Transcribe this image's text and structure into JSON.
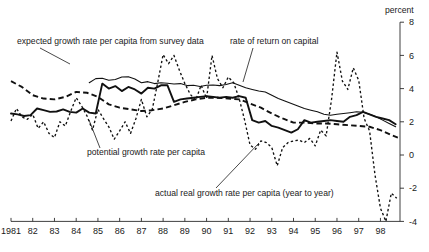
{
  "chart_data": {
    "type": "line",
    "title": "",
    "xlabel": "",
    "ylabel": "percent",
    "ylabel_position": "top-right",
    "grid": false,
    "legend": "annotations-with-leader-lines",
    "xlim": [
      1981.0,
      1998.9
    ],
    "ylim": [
      -4,
      8
    ],
    "yticks": [
      8,
      6,
      4,
      2,
      0,
      -2,
      -4
    ],
    "ytick_labels": [
      "8",
      "6",
      "4",
      "2",
      "0",
      "-2",
      "-4"
    ],
    "xticks": [
      1981,
      1982,
      1983,
      1984,
      1985,
      1986,
      1987,
      1988,
      1989,
      1990,
      1991,
      1992,
      1993,
      1994,
      1995,
      1996,
      1997,
      1998
    ],
    "xtick_labels": [
      "1981",
      "82",
      "83",
      "84",
      "85",
      "86",
      "87",
      "88",
      "89",
      "90",
      "91",
      "92",
      "93",
      "94",
      "95",
      "96",
      "97",
      "98"
    ],
    "axis_side": "right",
    "series": [
      {
        "name": "rate of return on capital",
        "style": "solid-thin",
        "x": [
          1984.6,
          1984.9,
          1985.2,
          1985.5,
          1985.8,
          1986.1,
          1986.4,
          1986.7,
          1987.0,
          1987.3,
          1987.6,
          1987.9,
          1988.2,
          1988.5,
          1988.8,
          1989.1,
          1989.4,
          1989.7,
          1990.0,
          1990.3,
          1990.6,
          1990.9,
          1991.2,
          1991.5,
          1991.8,
          1992.1,
          1992.4,
          1992.7,
          1993.0,
          1993.3,
          1993.6,
          1993.9,
          1994.2,
          1994.5,
          1994.8,
          1995.1,
          1995.4,
          1995.7,
          1996.0,
          1996.3,
          1996.6,
          1996.9,
          1997.2,
          1997.5,
          1997.8,
          1998.1,
          1998.4,
          1998.7
        ],
        "values": [
          4.35,
          4.6,
          4.62,
          4.5,
          4.55,
          4.7,
          4.72,
          4.58,
          4.35,
          4.42,
          4.3,
          4.35,
          4.32,
          4.28,
          4.3,
          4.18,
          4.2,
          4.12,
          4.2,
          4.22,
          4.18,
          4.25,
          4.35,
          4.2,
          4.05,
          3.95,
          3.85,
          3.8,
          3.6,
          3.4,
          3.25,
          3.1,
          2.95,
          2.8,
          2.7,
          2.6,
          2.45,
          2.4,
          2.45,
          2.5,
          2.55,
          2.6,
          2.58,
          2.45,
          2.3,
          2.1,
          1.9,
          1.7
        ]
      },
      {
        "name": "potential growth rate per capita",
        "style": "solid-thick",
        "x": [
          1981.0,
          1981.3,
          1981.6,
          1981.9,
          1982.2,
          1982.5,
          1982.8,
          1983.1,
          1983.4,
          1983.7,
          1984.0,
          1984.3,
          1984.6,
          1984.9,
          1985.2,
          1985.5,
          1985.8,
          1986.1,
          1986.4,
          1986.7,
          1987.0,
          1987.3,
          1987.6,
          1987.9,
          1988.2,
          1988.5,
          1988.8,
          1989.1,
          1989.4,
          1989.7,
          1990.0,
          1990.3,
          1990.6,
          1990.9,
          1991.2,
          1991.5,
          1991.8,
          1992.1,
          1992.4,
          1992.7,
          1993.0,
          1993.3,
          1993.6,
          1993.9,
          1994.2,
          1994.5,
          1994.8,
          1995.1,
          1995.4,
          1995.7,
          1996.0,
          1996.3,
          1996.6,
          1996.9,
          1997.2,
          1997.5,
          1997.8,
          1998.1,
          1998.4,
          1998.7
        ],
        "values": [
          2.5,
          2.45,
          2.35,
          2.4,
          2.8,
          2.7,
          2.6,
          2.62,
          2.75,
          2.6,
          2.55,
          2.8,
          2.55,
          2.5,
          4.3,
          4.0,
          4.15,
          3.85,
          4.1,
          3.95,
          3.7,
          4.05,
          4.0,
          4.2,
          4.2,
          3.2,
          3.35,
          3.4,
          3.45,
          3.5,
          3.55,
          3.5,
          3.45,
          3.5,
          3.45,
          3.55,
          3.45,
          2.1,
          1.95,
          2.05,
          1.75,
          1.65,
          1.5,
          1.35,
          1.55,
          2.1,
          1.95,
          2.0,
          2.05,
          2.1,
          2.05,
          2.0,
          2.3,
          2.4,
          2.6,
          2.45,
          2.3,
          2.2,
          2.1,
          1.85
        ]
      },
      {
        "name": "expected growth rate per capita from survey data",
        "style": "dashed-long",
        "x": [
          1981.0,
          1981.5,
          1982.0,
          1982.5,
          1983.0,
          1983.5,
          1984.0,
          1984.5,
          1985.0,
          1985.5,
          1986.0,
          1986.5,
          1987.0,
          1987.5,
          1988.0,
          1988.5,
          1989.0,
          1989.5,
          1990.0,
          1990.5,
          1991.0,
          1991.5,
          1992.0,
          1992.5,
          1993.0,
          1993.5,
          1994.0,
          1994.5,
          1995.0,
          1995.5,
          1996.0,
          1996.5,
          1997.0,
          1997.5,
          1998.0,
          1998.5,
          1998.8
        ],
        "values": [
          4.45,
          4.1,
          3.6,
          3.4,
          3.35,
          3.5,
          3.8,
          3.75,
          3.5,
          3.05,
          2.85,
          2.75,
          2.65,
          2.7,
          2.8,
          3.0,
          3.2,
          3.35,
          3.45,
          3.45,
          3.4,
          3.35,
          3.1,
          2.85,
          2.5,
          2.2,
          1.95,
          1.95,
          1.9,
          1.9,
          1.85,
          1.8,
          1.75,
          1.7,
          1.5,
          1.2,
          1.05
        ]
      },
      {
        "name": "actual real growth rate per capita (year to year)",
        "style": "dotted",
        "x": [
          1981.0,
          1981.25,
          1981.5,
          1981.75,
          1982.0,
          1982.25,
          1982.5,
          1982.75,
          1983.0,
          1983.25,
          1983.5,
          1983.75,
          1984.0,
          1984.25,
          1984.5,
          1984.75,
          1985.0,
          1985.25,
          1985.5,
          1985.75,
          1986.0,
          1986.25,
          1986.5,
          1986.75,
          1987.0,
          1987.25,
          1987.5,
          1987.75,
          1988.0,
          1988.25,
          1988.5,
          1988.75,
          1989.0,
          1989.25,
          1989.5,
          1989.75,
          1990.0,
          1990.25,
          1990.5,
          1990.75,
          1991.0,
          1991.25,
          1991.5,
          1991.75,
          1992.0,
          1992.25,
          1992.5,
          1992.75,
          1993.0,
          1993.25,
          1993.5,
          1993.75,
          1994.0,
          1994.25,
          1994.5,
          1994.75,
          1995.0,
          1995.25,
          1995.5,
          1995.75,
          1996.0,
          1996.25,
          1996.5,
          1996.75,
          1997.0,
          1997.25,
          1997.5,
          1997.75,
          1998.0,
          1998.25,
          1998.5,
          1998.75
        ],
        "values": [
          2.05,
          2.8,
          2.3,
          2.15,
          2.45,
          1.6,
          2.0,
          1.3,
          1.05,
          2.0,
          1.75,
          2.65,
          3.45,
          2.95,
          2.35,
          1.5,
          2.75,
          2.2,
          1.7,
          0.95,
          1.45,
          2.0,
          1.3,
          2.2,
          3.35,
          2.3,
          2.75,
          4.35,
          6.05,
          5.5,
          6.0,
          5.1,
          4.3,
          3.65,
          3.3,
          4.2,
          3.4,
          6.0,
          4.6,
          4.05,
          4.7,
          4.35,
          3.4,
          2.1,
          0.6,
          0.35,
          0.85,
          0.75,
          0.45,
          -0.65,
          0.45,
          0.75,
          0.85,
          0.9,
          0.75,
          1.0,
          0.55,
          1.5,
          1.15,
          3.35,
          6.2,
          4.45,
          3.95,
          5.25,
          4.5,
          2.2,
          1.45,
          -1.2,
          -3.2,
          -4.0,
          -2.3,
          -2.6
        ]
      }
    ]
  },
  "annotations": [
    {
      "id": "expected-growth",
      "text": "expected growth rate per capita from survey data",
      "text_x": 17,
      "text_y": 44,
      "leader": "M 40 48 L 70 64"
    },
    {
      "id": "rate-of-return",
      "text": "rate of return on capital",
      "text_x": 230,
      "text_y": 44,
      "leader": "M 253 48 L 243 82"
    },
    {
      "id": "potential-growth",
      "text": "potential growth rate per capita",
      "text_x": 87,
      "text_y": 155,
      "leader": "M 100 148 L 89 120"
    },
    {
      "id": "actual-real-growth",
      "text": "actual real growth rate per capita (year to year)",
      "text_x": 155,
      "text_y": 196,
      "leader": "M 216 188 L 259 143"
    }
  ]
}
